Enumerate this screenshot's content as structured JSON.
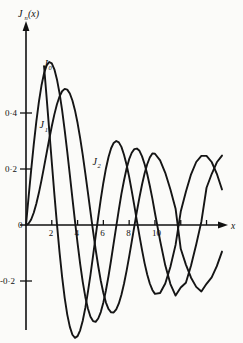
{
  "chart_data": {
    "type": "line",
    "title": "",
    "xlabel": "x",
    "ylabel": "J_n(x)",
    "ylabel_base": "J",
    "ylabel_sub": "n",
    "ylabel_arg": "(x)",
    "xlim": [
      0,
      15.2
    ],
    "ylim": [
      -0.3,
      0.62
    ],
    "grid": false,
    "legend_position": "inline-annotations",
    "x_ticks": [
      0,
      2,
      4,
      6,
      8,
      10,
      12,
      14
    ],
    "x_tick_labels": [
      "0",
      "2",
      "4",
      "6",
      "8",
      "10",
      "",
      ""
    ],
    "y_ticks": [
      -0.2,
      0,
      0.2,
      0.4
    ],
    "y_tick_labels": [
      "-0·2",
      "0",
      "0·2",
      "0·4"
    ],
    "annotations": [
      {
        "name": "J0",
        "base": "J",
        "sub": "0",
        "x": 1.35,
        "y": 0.565
      },
      {
        "name": "J1",
        "base": "J",
        "sub": "1",
        "x": 1.05,
        "y": 0.345
      },
      {
        "name": "J2",
        "base": "J",
        "sub": "2",
        "x": 5.15,
        "y": 0.215
      }
    ],
    "series": [
      {
        "name": "J0",
        "label": "J_0(x)",
        "x": [
          0.8,
          1.0,
          1.2,
          1.4,
          1.6,
          1.8,
          2.0,
          2.2,
          2.4,
          2.6,
          2.8,
          3.0,
          3.2,
          3.4,
          3.6,
          3.8,
          4.0,
          4.2,
          4.4,
          4.6,
          4.8,
          5.0,
          5.2,
          5.4,
          5.6,
          5.8,
          6.0,
          6.2,
          6.4,
          6.6,
          6.8,
          7.0,
          7.2,
          7.4,
          7.6,
          7.8,
          8.0,
          8.2,
          8.4,
          8.6,
          8.8,
          9.0,
          9.2,
          9.4,
          9.6,
          9.8,
          10.0,
          10.4,
          10.8,
          11.2,
          11.6,
          12.0,
          12.4,
          12.8,
          13.2,
          13.6,
          14.0,
          14.4,
          14.8,
          15.2
        ],
        "y": [
          0.846,
          0.765,
          0.671,
          0.567,
          0.455,
          0.34,
          0.224,
          0.11,
          0.003,
          -0.097,
          -0.185,
          -0.26,
          -0.32,
          -0.364,
          -0.392,
          -0.403,
          -0.397,
          -0.376,
          -0.342,
          -0.296,
          -0.24,
          -0.178,
          -0.11,
          -0.041,
          0.027,
          0.092,
          0.151,
          0.202,
          0.243,
          0.274,
          0.293,
          0.3,
          0.295,
          0.279,
          0.251,
          0.215,
          0.172,
          0.122,
          0.069,
          0.015,
          -0.039,
          -0.09,
          -0.137,
          -0.177,
          -0.209,
          -0.232,
          -0.246,
          -0.243,
          -0.209,
          -0.149,
          -0.071,
          0.048,
          0.119,
          0.181,
          0.225,
          0.247,
          0.247,
          0.225,
          0.183,
          0.127
        ]
      },
      {
        "name": "J1",
        "label": "J_1(x)",
        "x": [
          0.0,
          0.2,
          0.4,
          0.6,
          0.8,
          1.0,
          1.2,
          1.4,
          1.6,
          1.8,
          2.0,
          2.2,
          2.4,
          2.6,
          2.8,
          3.0,
          3.2,
          3.4,
          3.6,
          3.8,
          4.0,
          4.2,
          4.4,
          4.6,
          4.8,
          5.0,
          5.2,
          5.4,
          5.6,
          5.8,
          6.0,
          6.2,
          6.4,
          6.6,
          6.8,
          7.0,
          7.2,
          7.4,
          7.6,
          7.8,
          8.0,
          8.2,
          8.4,
          8.6,
          8.8,
          9.0,
          9.2,
          9.4,
          9.6,
          9.8,
          10.0,
          10.4,
          10.8,
          11.2,
          11.6,
          12.0,
          12.4,
          12.8,
          13.2,
          13.6,
          14.0,
          14.4,
          14.8,
          15.2
        ],
        "y": [
          0.0,
          0.0995,
          0.196,
          0.287,
          0.369,
          0.44,
          0.498,
          0.542,
          0.57,
          0.582,
          0.577,
          0.556,
          0.52,
          0.471,
          0.41,
          0.339,
          0.261,
          0.179,
          0.095,
          0.013,
          -0.066,
          -0.139,
          -0.203,
          -0.257,
          -0.298,
          -0.328,
          -0.343,
          -0.346,
          -0.334,
          -0.311,
          -0.277,
          -0.233,
          -0.182,
          -0.125,
          -0.065,
          -0.005,
          0.055,
          0.111,
          0.159,
          0.202,
          0.235,
          0.258,
          0.271,
          0.273,
          0.265,
          0.245,
          0.217,
          0.182,
          0.14,
          0.094,
          0.043,
          -0.056,
          -0.144,
          -0.211,
          -0.252,
          -0.223,
          -0.206,
          -0.145,
          -0.07,
          0.012,
          0.133,
          0.182,
          0.224,
          0.248
        ]
      },
      {
        "name": "J2",
        "label": "J_2(x)",
        "x": [
          0.0,
          0.2,
          0.4,
          0.6,
          0.8,
          1.0,
          1.2,
          1.4,
          1.6,
          1.8,
          2.0,
          2.2,
          2.4,
          2.6,
          2.8,
          3.0,
          3.2,
          3.4,
          3.6,
          3.8,
          4.0,
          4.2,
          4.4,
          4.6,
          4.8,
          5.0,
          5.2,
          5.4,
          5.6,
          5.8,
          6.0,
          6.2,
          6.4,
          6.6,
          6.8,
          7.0,
          7.2,
          7.4,
          7.6,
          7.8,
          8.0,
          8.2,
          8.4,
          8.6,
          8.8,
          9.0,
          9.2,
          9.4,
          9.6,
          9.8,
          10.0,
          10.4,
          10.8,
          11.2,
          11.6,
          12.0,
          12.4,
          12.8,
          13.2,
          13.6,
          14.0,
          14.4,
          14.8,
          15.2
        ],
        "y": [
          0.0,
          0.00499,
          0.0197,
          0.0437,
          0.0758,
          0.1149,
          0.1593,
          0.2074,
          0.257,
          0.3061,
          0.3528,
          0.3951,
          0.431,
          0.459,
          0.4777,
          0.4861,
          0.4835,
          0.4697,
          0.4448,
          0.4093,
          0.3641,
          0.3105,
          0.2501,
          0.1846,
          0.1161,
          0.0466,
          -0.0217,
          -0.0867,
          -0.1464,
          -0.199,
          -0.2429,
          -0.2769,
          -0.3001,
          -0.3119,
          -0.3123,
          -0.3014,
          -0.28,
          -0.249,
          -0.2097,
          -0.1638,
          -0.113,
          -0.0594,
          -0.0049,
          0.0484,
          0.0988,
          0.1448,
          0.1846,
          0.217,
          0.241,
          0.2558,
          0.2546,
          0.2307,
          0.1863,
          0.1267,
          0.0584,
          -0.0849,
          -0.1415,
          -0.1881,
          -0.221,
          -0.2374,
          -0.21,
          -0.1872,
          -0.147,
          -0.095
        ]
      }
    ]
  },
  "axes": {
    "x_arrow_label": "x",
    "y_axis_label": "J"
  }
}
